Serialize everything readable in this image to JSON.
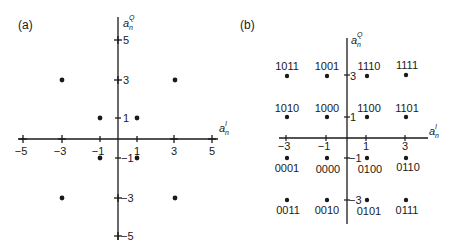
{
  "panels": [
    {
      "id": "a",
      "label": "(a)",
      "x_axis_label": "a",
      "x_axis_sub": "n",
      "x_axis_sup": "I",
      "y_axis_label": "a",
      "y_axis_sub": "n",
      "y_axis_sup": "Q",
      "x_ticks": [
        "−5",
        "−3",
        "−1",
        "1",
        "3",
        "5"
      ],
      "y_ticks": [
        "5",
        "3",
        "1",
        "−1",
        "−3",
        "−5"
      ],
      "points": [
        {
          "i": -3,
          "q": 3
        },
        {
          "i": 3,
          "q": 3
        },
        {
          "i": -1,
          "q": 1
        },
        {
          "i": 1,
          "q": 1
        },
        {
          "i": -1,
          "q": -1
        },
        {
          "i": 1,
          "q": -1
        },
        {
          "i": -3,
          "q": -3
        },
        {
          "i": 3,
          "q": -3
        }
      ]
    },
    {
      "id": "b",
      "label": "(b)",
      "x_axis_label": "a",
      "x_axis_sub": "n",
      "x_axis_sup": "I",
      "y_axis_label": "a",
      "y_axis_sub": "n",
      "y_axis_sup": "Q",
      "x_ticks": [
        "−3",
        "−1",
        "1",
        "3"
      ],
      "y_ticks": [
        "3",
        "1",
        "−1",
        "−3"
      ],
      "points": [
        {
          "i": -3,
          "q": 3,
          "code": "1011"
        },
        {
          "i": -1,
          "q": 3,
          "code": "1001"
        },
        {
          "i": 1,
          "q": 3,
          "code": "1110"
        },
        {
          "i": 3,
          "q": 3,
          "code": "1111"
        },
        {
          "i": -3,
          "q": 1,
          "code": "1010"
        },
        {
          "i": -1,
          "q": 1,
          "code": "1000"
        },
        {
          "i": 1,
          "q": 1,
          "code": "1100"
        },
        {
          "i": 3,
          "q": 1,
          "code": "1101"
        },
        {
          "i": -3,
          "q": -1,
          "code": "0001"
        },
        {
          "i": -1,
          "q": -1,
          "code": "0000"
        },
        {
          "i": 1,
          "q": -1,
          "code": "0100"
        },
        {
          "i": 3,
          "q": -1,
          "code": "0110"
        },
        {
          "i": -3,
          "q": -3,
          "code": "0011"
        },
        {
          "i": -1,
          "q": -3,
          "code": "0010"
        },
        {
          "i": 1,
          "q": -3,
          "code": "0101"
        },
        {
          "i": 3,
          "q": -3,
          "code": "0111"
        }
      ]
    }
  ]
}
